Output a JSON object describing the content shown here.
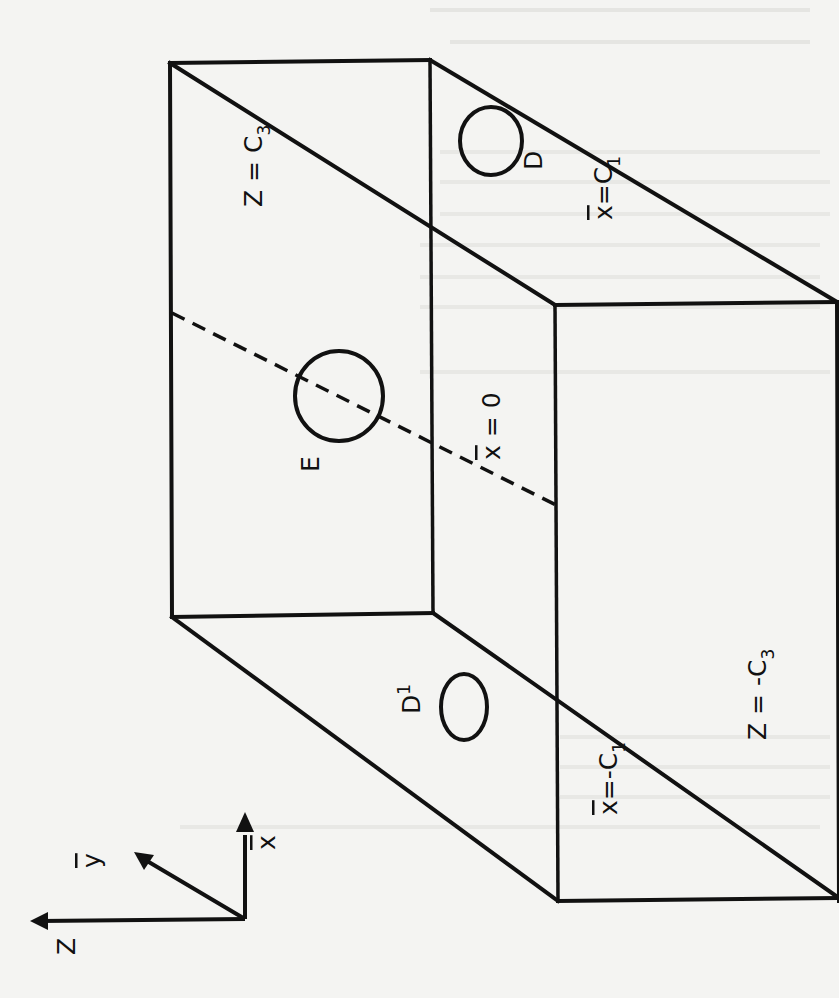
{
  "figure": {
    "faces": {
      "top": {
        "label": "Z",
        "value": "C",
        "subscript": "3",
        "text": "Z = C3"
      },
      "bottom": {
        "label": "Z",
        "value": "-C",
        "subscript": "3",
        "text": "Z = -C3"
      },
      "right": {
        "label": "x̄",
        "value": "C",
        "subscript": "1",
        "text": "x̄ = C1"
      },
      "left": {
        "label": "x̄",
        "value": "-C",
        "subscript": "1",
        "text": "x̄ = -C1"
      },
      "midplane": {
        "label": "x̄",
        "value": "0",
        "text": "x̄ = 0"
      }
    },
    "holes": [
      {
        "id": "D",
        "label": "D",
        "location": "face x̄ = C1"
      },
      {
        "id": "E",
        "label": "E",
        "location": "plane x̄ = 0"
      },
      {
        "id": "D1",
        "label": "D",
        "superscript": "1",
        "location": "face x̄ = -C1"
      }
    ],
    "axes": {
      "z": "Z",
      "y": "ȳ",
      "x": "x̄"
    }
  }
}
